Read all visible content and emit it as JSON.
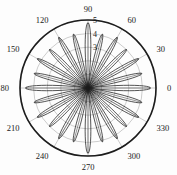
{
  "figure": {
    "kind": "polar-plot",
    "background_color": "#fdfdfd",
    "line_color": "#1c1c1c",
    "grid_color": "#8a8a8a",
    "label_color": "#1a1a1a"
  },
  "chart_data": {
    "type": "line",
    "title": "",
    "subtitle": "",
    "xlabel": "",
    "ylabel": "",
    "projection": "polar",
    "grid": true,
    "legend": null,
    "legend_position": "none",
    "angle_unit": "degrees",
    "theta_direction": "counterclockwise",
    "theta_zero_location": "E",
    "rlim": [
      0,
      5
    ],
    "r_ticks": [
      1,
      2,
      3,
      4,
      5
    ],
    "r_tick_labels": [
      "1",
      "2",
      "3",
      "4",
      "5"
    ],
    "r_tick_labels_visible": [
      "5",
      "4",
      "3"
    ],
    "theta_ticks": [
      0,
      30,
      60,
      90,
      120,
      150,
      180,
      210,
      240,
      270,
      300,
      330
    ],
    "theta_tick_labels": [
      "0",
      "30",
      "60",
      "90",
      "120",
      "150",
      "180",
      "210",
      "240",
      "270",
      "300",
      "330"
    ],
    "lobes": [
      {
        "angle_deg": 0,
        "peak_r": 4.6,
        "half_width_deg": 7
      },
      {
        "angle_deg": 15,
        "peak_r": 4.1,
        "half_width_deg": 6
      },
      {
        "angle_deg": 30,
        "peak_r": 4.3,
        "half_width_deg": 6
      },
      {
        "angle_deg": 45,
        "peak_r": 4.0,
        "half_width_deg": 6
      },
      {
        "angle_deg": 60,
        "peak_r": 4.3,
        "half_width_deg": 6
      },
      {
        "angle_deg": 75,
        "peak_r": 4.1,
        "half_width_deg": 6
      },
      {
        "angle_deg": 90,
        "peak_r": 4.8,
        "half_width_deg": 7
      },
      {
        "angle_deg": 105,
        "peak_r": 4.1,
        "half_width_deg": 6
      },
      {
        "angle_deg": 120,
        "peak_r": 4.3,
        "half_width_deg": 6
      },
      {
        "angle_deg": 135,
        "peak_r": 4.0,
        "half_width_deg": 6
      },
      {
        "angle_deg": 150,
        "peak_r": 4.3,
        "half_width_deg": 6
      },
      {
        "angle_deg": 165,
        "peak_r": 4.1,
        "half_width_deg": 6
      },
      {
        "angle_deg": 180,
        "peak_r": 4.6,
        "half_width_deg": 7
      },
      {
        "angle_deg": 195,
        "peak_r": 4.1,
        "half_width_deg": 6
      },
      {
        "angle_deg": 210,
        "peak_r": 4.3,
        "half_width_deg": 6
      },
      {
        "angle_deg": 225,
        "peak_r": 4.0,
        "half_width_deg": 6
      },
      {
        "angle_deg": 240,
        "peak_r": 4.3,
        "half_width_deg": 6
      },
      {
        "angle_deg": 255,
        "peak_r": 4.1,
        "half_width_deg": 6
      },
      {
        "angle_deg": 270,
        "peak_r": 4.8,
        "half_width_deg": 7
      },
      {
        "angle_deg": 285,
        "peak_r": 4.1,
        "half_width_deg": 6
      },
      {
        "angle_deg": 300,
        "peak_r": 4.3,
        "half_width_deg": 6
      },
      {
        "angle_deg": 315,
        "peak_r": 4.0,
        "half_width_deg": 6
      },
      {
        "angle_deg": 330,
        "peak_r": 4.3,
        "half_width_deg": 6
      },
      {
        "angle_deg": 345,
        "peak_r": 4.1,
        "half_width_deg": 6
      }
    ]
  }
}
